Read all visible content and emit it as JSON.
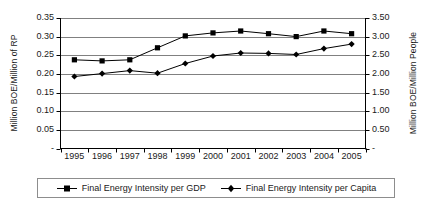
{
  "chart_data": {
    "type": "line",
    "title": "",
    "xlabel": "",
    "categories": [
      "1995",
      "1996",
      "1997",
      "1998",
      "1999",
      "2000",
      "2001",
      "2002",
      "2003",
      "2004",
      "2005"
    ],
    "grid": true,
    "legend_position": "bottom",
    "axes": {
      "left": {
        "label": "Million BOE/Million of RP",
        "ticks": [
          "0.35",
          "0.30",
          "0.25",
          "0.20",
          "0.15",
          "0.10",
          "0.05",
          "-"
        ],
        "tick_values": [
          0.35,
          0.3,
          0.25,
          0.2,
          0.15,
          0.1,
          0.05,
          0.0
        ],
        "ylim": [
          0.0,
          0.35
        ]
      },
      "right": {
        "label": "Million BOE/Million People",
        "ticks": [
          "3.50",
          "3.00",
          "2.50",
          "2.00",
          "1.50",
          "1.00",
          "0.50",
          "-"
        ],
        "tick_values": [
          3.5,
          3.0,
          2.5,
          2.0,
          1.5,
          1.0,
          0.5,
          0.0
        ],
        "ylim": [
          0.0,
          3.5
        ]
      }
    },
    "series": [
      {
        "name": "Final Energy Intensity per GDP",
        "axis": "left",
        "marker": "square",
        "color": "#000000",
        "values": [
          0.238,
          0.235,
          0.238,
          0.27,
          0.302,
          0.31,
          0.315,
          0.308,
          0.3,
          0.315,
          0.308
        ]
      },
      {
        "name": "Final Energy Intensity per Capita",
        "axis": "right",
        "marker": "diamond",
        "color": "#000000",
        "values": [
          1.93,
          2.01,
          2.09,
          2.02,
          2.28,
          2.48,
          2.56,
          2.55,
          2.52,
          2.68,
          2.8
        ]
      }
    ]
  },
  "legend": {
    "items": [
      {
        "label": "Final Energy Intensity per GDP",
        "marker": "square"
      },
      {
        "label": "Final Energy Intensity per Capita",
        "marker": "diamond"
      }
    ]
  }
}
